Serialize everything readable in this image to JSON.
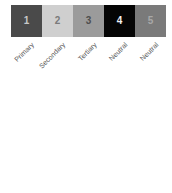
{
  "palette": {
    "swatches": [
      {
        "number": "1",
        "label": "Primary",
        "color": "#4a4a4a",
        "text_color": "#c8c8c8"
      },
      {
        "number": "2",
        "label": "Secondary",
        "color": "#cfcfcf",
        "text_color": "#7a7a7a"
      },
      {
        "number": "3",
        "label": "Tertiary",
        "color": "#9b9b9b",
        "text_color": "#4e4e4e"
      },
      {
        "number": "4",
        "label": "Neutral",
        "color": "#050505",
        "text_color": "#f2f2f2"
      },
      {
        "number": "5",
        "label": "Neutral",
        "color": "#7a7a7a",
        "text_color": "#a8a8a8"
      }
    ]
  }
}
